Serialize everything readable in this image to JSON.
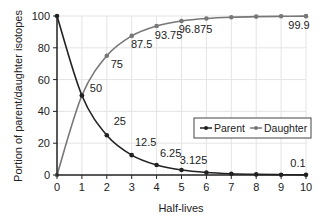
{
  "chart_data": {
    "type": "line",
    "title": "",
    "xlabel": "Half-lives",
    "ylabel": "Portion of parent/daughter isotopes",
    "x": [
      0,
      1,
      2,
      3,
      4,
      5,
      6,
      7,
      8,
      9,
      10
    ],
    "xlim": [
      0,
      10
    ],
    "ylim": [
      0,
      100
    ],
    "x_ticks": [
      "0",
      "1",
      "2",
      "3",
      "4",
      "5",
      "6",
      "7",
      "8",
      "9",
      "10"
    ],
    "y_ticks": [
      "0",
      "20",
      "40",
      "60",
      "80",
      "100"
    ],
    "grid": true,
    "legend_position": "right-center",
    "series": [
      {
        "name": "Parent",
        "color": "#222222",
        "values": [
          100,
          50,
          25,
          12.5,
          6.25,
          3.125,
          1.5625,
          0.78,
          0.39,
          0.2,
          0.1
        ],
        "labels": [
          {
            "x": 2,
            "y": 25,
            "text": "25"
          },
          {
            "x": 3,
            "y": 12.5,
            "text": "12.5"
          },
          {
            "x": 4,
            "y": 6.25,
            "text": "6.25"
          },
          {
            "x": 5,
            "y": 3.125,
            "text": "3.125"
          },
          {
            "x": 10,
            "y": 0.1,
            "text": "0.1"
          }
        ]
      },
      {
        "name": "Daughter",
        "color": "#777777",
        "values": [
          0,
          50,
          75,
          87.5,
          93.75,
          96.875,
          98.44,
          99.22,
          99.61,
          99.8,
          99.9
        ],
        "labels": [
          {
            "x": 1,
            "y": 50,
            "text": "50"
          },
          {
            "x": 2,
            "y": 75,
            "text": "75"
          },
          {
            "x": 3,
            "y": 87.5,
            "text": "87.5"
          },
          {
            "x": 4,
            "y": 93.75,
            "text": "93.75"
          },
          {
            "x": 5,
            "y": 96.875,
            "text": "96.875"
          },
          {
            "x": 10,
            "y": 99.9,
            "text": "99.9"
          }
        ]
      }
    ]
  },
  "legend": {
    "parent_label": "Parent",
    "daughter_label": "Daughter"
  },
  "axes": {
    "xlabel": "Half-lives",
    "ylabel": "Portion of parent/daughter isotopes"
  }
}
